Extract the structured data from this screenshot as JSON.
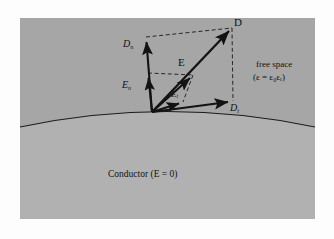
{
  "figure": {
    "panel": {
      "background_color": "#a6a6a6",
      "conductor_fill_color": "#b0b0b0",
      "border_color": "#8f8f8f"
    },
    "regions": {
      "free_space_label": "free space",
      "permittivity_expression": "(ε = ε₀εᵣ)",
      "conductor_label": "Conductor (E = 0)"
    },
    "vectors": [
      {
        "name": "D",
        "label": "D",
        "base": "D",
        "subscript": "",
        "style": "solid",
        "from": [
          152,
          112
        ],
        "to": [
          232,
          28
        ]
      },
      {
        "name": "E",
        "label": "E",
        "base": "E",
        "subscript": "",
        "style": "solid",
        "from": [
          152,
          112
        ],
        "to": [
          193,
          75
        ]
      },
      {
        "name": "Dn",
        "label": "Dn",
        "base": "D",
        "subscript": "n",
        "style": "solid",
        "from": [
          152,
          112
        ],
        "to": [
          146,
          37
        ]
      },
      {
        "name": "En",
        "label": "En",
        "base": "E",
        "subscript": "n",
        "style": "solid",
        "from": [
          152,
          112
        ],
        "to": [
          148,
          73
        ]
      },
      {
        "name": "Et",
        "label": "Et",
        "base": "E",
        "subscript": "t",
        "style": "solid",
        "from": [
          152,
          112
        ],
        "to": [
          183,
          102
        ]
      },
      {
        "name": "Dt",
        "label": "Dt",
        "base": "D",
        "subscript": "t",
        "style": "solid",
        "from": [
          152,
          112
        ],
        "to": [
          233,
          101
        ]
      }
    ],
    "construction_lines": [
      {
        "name": "dn-to-d",
        "style": "dashed",
        "from": [
          146,
          37
        ],
        "to": [
          232,
          28
        ]
      },
      {
        "name": "d-to-dt",
        "style": "dashed",
        "from": [
          232,
          28
        ],
        "to": [
          233,
          101
        ]
      },
      {
        "name": "en-to-e",
        "style": "dashed",
        "from": [
          148,
          73
        ],
        "to": [
          193,
          75
        ]
      },
      {
        "name": "e-to-et",
        "style": "dashed",
        "from": [
          193,
          75
        ],
        "to": [
          183,
          102
        ]
      }
    ],
    "colors": {
      "vector_stroke": "#131313",
      "dashed_stroke": "#1a1a1a",
      "surface_stroke": "#1b1b1b",
      "text": "#111111"
    }
  }
}
